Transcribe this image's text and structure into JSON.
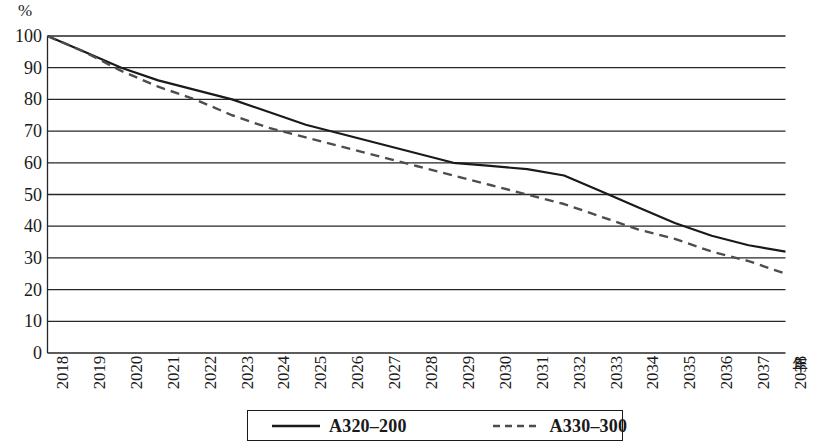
{
  "axes": {
    "y_unit_label": "%",
    "x_unit_label": "年"
  },
  "legend": {
    "items": [
      {
        "label": "A320–200",
        "style": "solid",
        "color": "#1a1a1a"
      },
      {
        "label": "A330–300",
        "style": "dashed",
        "color": "#4d4d4d"
      }
    ]
  },
  "chart_data": {
    "type": "line",
    "title": "",
    "xlabel": "年",
    "ylabel": "%",
    "ylim": [
      0,
      100
    ],
    "yticks": [
      0,
      10,
      20,
      30,
      40,
      50,
      60,
      70,
      80,
      90,
      100
    ],
    "ytick_labels": [
      "0",
      "10",
      "20",
      "30",
      "40",
      "50",
      "60",
      "70",
      "80",
      "90",
      "100"
    ],
    "grid": "horizontal",
    "legend_position": "bottom",
    "categories": [
      "2018",
      "2019",
      "2020",
      "2021",
      "2022",
      "2023",
      "2024",
      "2025",
      "2026",
      "2027",
      "2028",
      "2029",
      "2030",
      "2031",
      "2032",
      "2033",
      "2034",
      "2035",
      "2036",
      "2037",
      "2038"
    ],
    "series": [
      {
        "name": "A320–200",
        "style": "solid",
        "color": "#1a1a1a",
        "values": [
          100,
          95,
          90,
          86,
          83,
          80,
          76,
          72,
          69,
          66,
          63,
          60,
          59,
          58,
          56,
          51,
          46,
          41,
          37,
          34,
          32
        ]
      },
      {
        "name": "A330–300",
        "style": "dashed",
        "color": "#4d4d4d",
        "values": [
          100,
          95,
          89,
          84,
          80,
          75,
          71,
          68,
          65,
          62,
          59,
          56,
          53,
          50,
          47,
          43,
          39,
          36,
          32,
          29,
          25
        ]
      }
    ]
  }
}
